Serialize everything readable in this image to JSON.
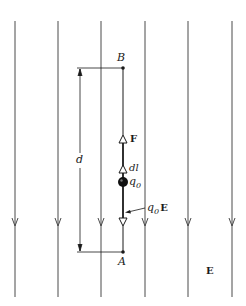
{
  "figure": {
    "field_label": "E",
    "field_direction": "down",
    "field_line_count": 6,
    "field_lines_x": [
      15,
      58,
      101,
      145,
      188,
      232
    ],
    "colors": {
      "line": "#4a4a4a",
      "path": "#1a1a1a",
      "background": "#ffffff"
    }
  },
  "points": {
    "A": {
      "label": "A"
    },
    "B": {
      "label": "B"
    }
  },
  "labels": {
    "distance": "d",
    "force": "F",
    "displacement": "dl",
    "charge": "q",
    "charge_sub": "0",
    "electric_force": "q",
    "electric_force_sub": "0",
    "electric_force_vec": "E",
    "field": "E"
  }
}
